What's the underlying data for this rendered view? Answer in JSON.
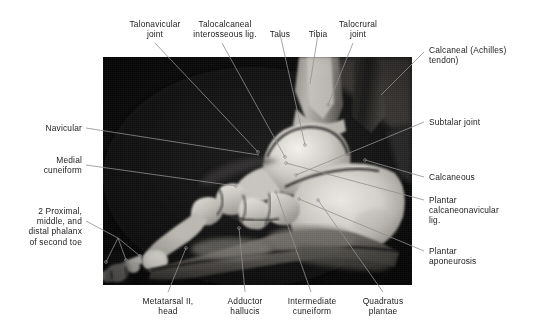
{
  "figure": {
    "modality": "MRI",
    "plate_background": "#050505",
    "page_background": "#ffffff",
    "label_color": "#1b1b1b",
    "leader_color": "#8f8f8f"
  },
  "labels": {
    "talonavicular_joint": "Talonavicular\njoint",
    "talocalcaneal_interosseous_lig": "Talocalcaneal\ninterosseous lig.",
    "talus": "Talus",
    "tibia": "Tibia",
    "talocrural_joint": "Talocrural\njoint",
    "calcaneal_achilles_tendon": "Calcaneal (Achilles)\ntendon)",
    "subtalar_joint": "Subtalar joint",
    "calcaneous": "Calcaneous",
    "plantar_calcaneonavicular_lig": "Plantar\ncalcaneonavicular\nlig.",
    "plantar_aponeurosis": "Plantar\naponeurosis",
    "navicular": "Navicular",
    "medial_cuneiform": "Medial\ncuneiform",
    "phalanges_second_toe": "2 Proximal,\nmiddle, and\ndistal phalanx\nof second toe",
    "metatarsal_ii_head": "Metatarsal II,\nhead",
    "adductor_hallucis": "Adductor\nhallucis",
    "intermediate_cuneiform": "Intermediate\ncuneiform",
    "quadratus_plantae": "Quadratus\nplantae"
  }
}
